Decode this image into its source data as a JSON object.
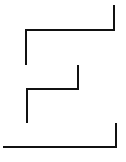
{
  "canvas": {
    "width": 126,
    "height": 162,
    "background": "#ffffff"
  },
  "style": {
    "stroke_color": "#111111",
    "stroke_width": 2
  },
  "shapes": [
    {
      "name": "upper-step-line",
      "points": "114,6 114,30 26,30 26,64"
    },
    {
      "name": "middle-step-line",
      "points": "78,66 78,89 27,89 27,122"
    },
    {
      "name": "bottom-bracket-line",
      "points": "116,124 116,147 4,147"
    }
  ]
}
